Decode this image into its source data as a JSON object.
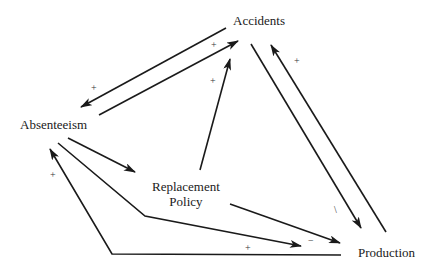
{
  "diagram": {
    "type": "causal-loop",
    "nodes": {
      "accidents": {
        "label": "Accidents"
      },
      "absenteeism": {
        "label": "Absenteeism"
      },
      "replacement_policy": {
        "line1": "Replacement",
        "line2": "Policy"
      },
      "production": {
        "label": "Production"
      }
    },
    "links": [
      {
        "from": "Accidents",
        "to": "Absenteeism",
        "sign": "+"
      },
      {
        "from": "Absenteeism",
        "to": "Accidents",
        "sign": "+"
      },
      {
        "from": "Replacement Policy",
        "to": "Accidents",
        "sign": "+"
      },
      {
        "from": "Accidents",
        "to": "Production",
        "sign": "−"
      },
      {
        "from": "Production",
        "to": "Accidents",
        "sign": "+"
      },
      {
        "from": "Absenteeism",
        "to": "Replacement Policy",
        "sign": ""
      },
      {
        "from": "Absenteeism",
        "to": "Production",
        "sign": "+"
      },
      {
        "from": "Replacement Policy",
        "to": "Production",
        "sign": "−"
      },
      {
        "from": "Production",
        "to": "Absenteeism",
        "sign": "+"
      }
    ],
    "signs": {
      "acc_abs": "+",
      "abs_acc": "+",
      "rep_acc": "+",
      "acc_prod": "\\",
      "prod_acc": "+",
      "abs_prod": "+",
      "rep_prod": "−",
      "prod_abs": "+"
    },
    "colors": {
      "line": "#1a1a1a",
      "background": "#ffffff"
    }
  }
}
